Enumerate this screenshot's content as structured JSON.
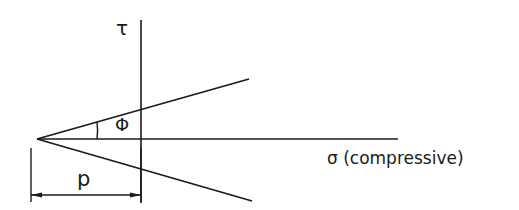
{
  "diagram": {
    "axes": {
      "vertical_label": "τ",
      "horizontal_label": "σ (compressive)"
    },
    "angle_label": "Φ",
    "dimension_label": "p",
    "colors": {
      "line": "#1a1a1a",
      "background": "#ffffff"
    }
  }
}
